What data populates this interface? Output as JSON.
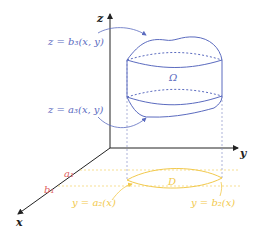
{
  "diagram": {
    "axes": {
      "x": "x",
      "y": "y",
      "z": "z"
    },
    "labels": {
      "upper_surface": "z = b₃(x, y)",
      "lower_surface": "z = a₃(x, y)",
      "solid_region": "Ω",
      "plane_region": "D",
      "x_lower": "a₁",
      "x_upper": "b₁",
      "lower_curve": "y = a₂(x)",
      "upper_curve": "y = b₂(x)"
    },
    "colors": {
      "surface_blue": "#5b6bbf",
      "region_yellow": "#f2c94c",
      "bounds_red": "#e06060",
      "axis": "#222222"
    }
  }
}
